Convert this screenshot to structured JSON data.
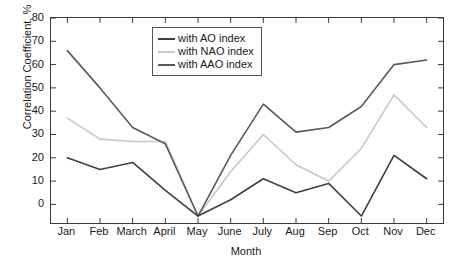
{
  "chart_data": {
    "type": "line",
    "title": "",
    "xlabel": "Month",
    "ylabel": "Correlation Coefficient, %",
    "categories": [
      "Jan",
      "Feb",
      "March",
      "April",
      "May",
      "June",
      "July",
      "Aug",
      "Sep",
      "Oct",
      "Nov",
      "Dec"
    ],
    "ylim": [
      -8,
      80
    ],
    "yticks": [
      0,
      10,
      20,
      30,
      40,
      50,
      60,
      70,
      80
    ],
    "ytick_labels": [
      "0",
      "10",
      "20",
      "30",
      "40",
      "50",
      "60",
      "70",
      "80"
    ],
    "grid": false,
    "legend_position": "top-center",
    "series": [
      {
        "name": "with AO index",
        "color": "#3f3f3f",
        "values": [
          20,
          15,
          18,
          6,
          -5,
          2,
          11,
          5,
          9,
          -5,
          21,
          11
        ]
      },
      {
        "name": "with NAO index",
        "color": "#c8c8c8",
        "values": [
          37,
          28,
          27,
          27,
          -5,
          14,
          30,
          17,
          10,
          24,
          47,
          33
        ]
      },
      {
        "name": "with AAO index",
        "color": "#5a5a5a",
        "values": [
          66,
          50,
          33,
          26,
          -5,
          21,
          43,
          31,
          33,
          42,
          60,
          62
        ]
      }
    ]
  },
  "axis": {
    "frame_color": "#3a3a3a",
    "text_color": "#1a1a1a"
  }
}
